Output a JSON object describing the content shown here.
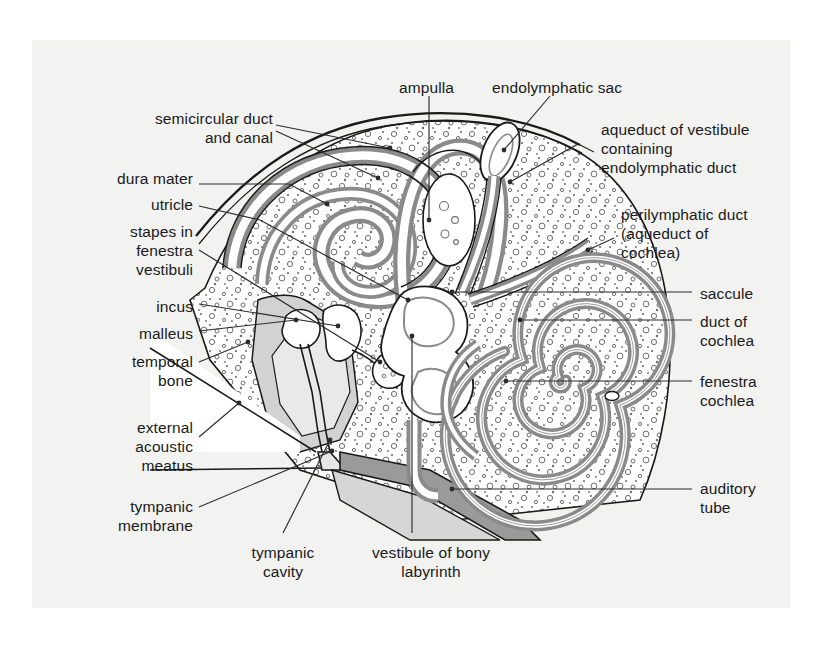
{
  "figure": {
    "canvas": {
      "width": 829,
      "height": 647
    },
    "panel": {
      "x": 32,
      "y": 40,
      "width": 758,
      "height": 568,
      "fill": "#f2f2f1"
    },
    "colors": {
      "background": "#ffffff",
      "panel": "#f2f2f1",
      "outline": "#1a1a1a",
      "labyrinth_wall": "#8a8a8a",
      "bone_stipple": "#6e6e6e",
      "cavity_light": "#e2e2e2",
      "cavity_mid": "#d2d2d2",
      "tube_gray": "#9a9a9a",
      "lumen": "#ffffff",
      "leader": "#2b2b2b"
    },
    "labels": [
      {
        "id": "semicircular-duct-and-canal",
        "text": "semicircular duct\nand canal",
        "align": "right",
        "x": 78,
        "y": 109,
        "w": 195
      },
      {
        "id": "dura-mater",
        "text": "dura mater",
        "align": "right",
        "x": 68,
        "y": 169,
        "w": 125
      },
      {
        "id": "utricle",
        "text": "utricle",
        "align": "right",
        "x": 68,
        "y": 195,
        "w": 125
      },
      {
        "id": "stapes-in-fenestra-vestibuli",
        "text": "stapes in\nfenestra\nvestibuli",
        "align": "right",
        "x": 68,
        "y": 222,
        "w": 125
      },
      {
        "id": "incus",
        "text": "incus",
        "align": "right",
        "x": 68,
        "y": 297,
        "w": 125
      },
      {
        "id": "malleus",
        "text": "malleus",
        "align": "right",
        "x": 68,
        "y": 324,
        "w": 125
      },
      {
        "id": "temporal-bone",
        "text": "temporal\nbone",
        "align": "right",
        "x": 68,
        "y": 352,
        "w": 125
      },
      {
        "id": "external-acoustic-meatus",
        "text": "external\nacoustic\nmeatus",
        "align": "right",
        "x": 68,
        "y": 418,
        "w": 125
      },
      {
        "id": "tympanic-membrane",
        "text": "tympanic\nmembrane",
        "align": "right",
        "x": 58,
        "y": 497,
        "w": 135
      },
      {
        "id": "ampulla",
        "text": "ampulla",
        "align": "left",
        "x": 399,
        "y": 78,
        "w": 120
      },
      {
        "id": "endolymphatic-sac",
        "text": "endolymphatic sac",
        "align": "left",
        "x": 492,
        "y": 78,
        "w": 190
      },
      {
        "id": "aqueduct-of-vestibule",
        "text": "aqueduct of vestibule\ncontaining\nendolymphatic duct",
        "align": "left",
        "x": 601,
        "y": 120,
        "w": 215
      },
      {
        "id": "perilymphatic-duct",
        "text": "perilymphatic duct\n(aqueduct of\ncochlea)",
        "align": "left",
        "x": 621,
        "y": 205,
        "w": 195
      },
      {
        "id": "saccule",
        "text": "saccule",
        "align": "left",
        "x": 700,
        "y": 284,
        "w": 120
      },
      {
        "id": "duct-of-cochlea",
        "text": "duct of\ncochlea",
        "align": "left",
        "x": 700,
        "y": 312,
        "w": 120
      },
      {
        "id": "fenestra-cochlea",
        "text": "fenestra\ncochlea",
        "align": "left",
        "x": 700,
        "y": 372,
        "w": 120
      },
      {
        "id": "auditory-tube",
        "text": "auditory\ntube",
        "align": "left",
        "x": 700,
        "y": 479,
        "w": 120
      },
      {
        "id": "tympanic-cavity",
        "text": "tympanic\ncavity",
        "align": "center",
        "x": 222,
        "y": 543,
        "w": 122
      },
      {
        "id": "vestibule-of-bony-labyrinth",
        "text": "vestibule of bony\nlabyrinth",
        "align": "center",
        "x": 336,
        "y": 543,
        "w": 190
      }
    ]
  }
}
